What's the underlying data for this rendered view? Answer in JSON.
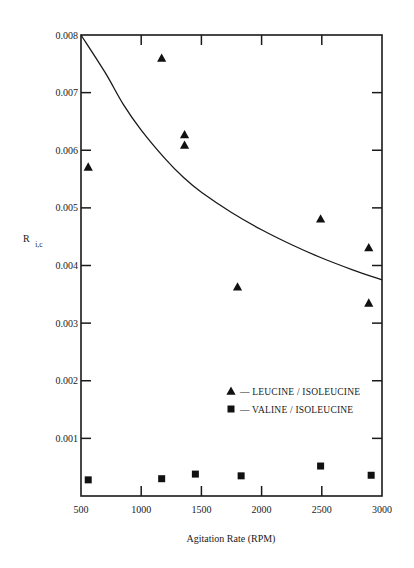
{
  "chart_data": {
    "type": "scatter",
    "title": "",
    "xlabel": "Agitation Rate (RPM)",
    "ylabel_main": "R",
    "ylabel_sub": "i,c",
    "xlim": [
      500,
      3000
    ],
    "ylim": [
      0,
      0.008
    ],
    "grid": false,
    "x_ticks": [
      500,
      1000,
      1500,
      2000,
      2500,
      3000
    ],
    "x_tick_labels": [
      "500",
      "1000",
      "1500",
      "2000",
      "2500",
      "3000"
    ],
    "y_ticks": [
      0.001,
      0.002,
      0.003,
      0.004,
      0.005,
      0.006,
      0.007,
      0.008
    ],
    "y_tick_labels": [
      "0.001",
      "0.002",
      "0.003",
      "0.004",
      "0.005",
      "0.006",
      "0.007",
      "0.008"
    ],
    "legend_position": "lower-right",
    "series": [
      {
        "name": "LEUCINE / ISOLEUCINE",
        "legend_label": "— LEUCINE / ISOLEUCINE",
        "marker": "triangle",
        "points": [
          [
            560,
            0.00571
          ],
          [
            1170,
            0.0076
          ],
          [
            1360,
            0.00627
          ],
          [
            1360,
            0.00609
          ],
          [
            1800,
            0.00363
          ],
          [
            2490,
            0.00481
          ],
          [
            2890,
            0.00431
          ],
          [
            2890,
            0.00335
          ]
        ]
      },
      {
        "name": "VALINE / ISOLEUCINE",
        "legend_label": "— VALINE / ISOLEUCINE",
        "marker": "square",
        "points": [
          [
            560,
            0.00028
          ],
          [
            1170,
            0.0003
          ],
          [
            1450,
            0.00038
          ],
          [
            1830,
            0.00035
          ],
          [
            2490,
            0.00052
          ],
          [
            2910,
            0.00036
          ]
        ]
      }
    ],
    "fit_curve": {
      "name": "Leucine/Isoleucine fit",
      "points": [
        [
          500,
          0.008
        ],
        [
          700,
          0.00735
        ],
        [
          850,
          0.0068
        ],
        [
          1000,
          0.00635
        ],
        [
          1200,
          0.00585
        ],
        [
          1350,
          0.00553
        ],
        [
          1500,
          0.00527
        ],
        [
          1750,
          0.00492
        ],
        [
          2000,
          0.00462
        ],
        [
          2250,
          0.00436
        ],
        [
          2500,
          0.00413
        ],
        [
          2750,
          0.00393
        ],
        [
          3000,
          0.00375
        ]
      ]
    }
  }
}
